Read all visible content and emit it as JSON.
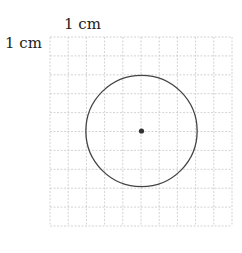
{
  "labels": {
    "horizontal_unit": "1 cm",
    "vertical_unit": "1 cm"
  },
  "grid": {
    "columns": 10,
    "rows": 10,
    "line_color": "#c8c8c8",
    "line_style": "dashed"
  },
  "circle": {
    "center_col": 5,
    "center_row": 5,
    "radius_cells": 3,
    "stroke_color": "#444444",
    "center_dot_color": "#333333"
  }
}
